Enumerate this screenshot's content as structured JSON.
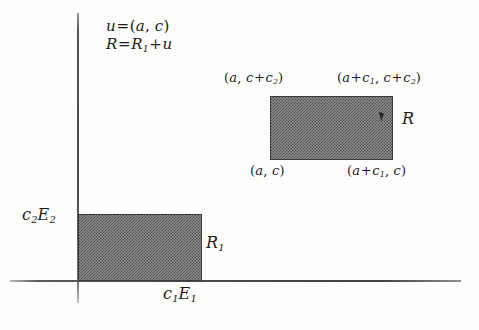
{
  "figure": {
    "background_color": "#fdfdfc",
    "axis_color": "#4a4a4a",
    "rect_fill_color": "#8c8c8c",
    "rect_border_color": "#3a3a3a"
  },
  "equations": {
    "line1": "u = (a, c)",
    "line2_prefix": "R",
    "line2": "R = R1 + u",
    "u_lhs": "u",
    "u_eq": "=",
    "u_rhs_open": "(",
    "u_a": "a",
    "u_comma": ", ",
    "u_c": "c",
    "u_rhs_close": ")",
    "R_lhs": "R",
    "R_eq": "=",
    "R_r1": "R",
    "R_r1_sub": "1",
    "R_plus": "+",
    "R_u": "u"
  },
  "upper_rect": {
    "name": "R",
    "label": "R",
    "corner_top_left": {
      "open": "(",
      "x": "a",
      "comma": ", ",
      "y_base": "c",
      "y_plus": "+",
      "y_term": "c",
      "y_sub": "2",
      "close": ")",
      "text": "(a, c+c2)"
    },
    "corner_top_right": {
      "open": "(",
      "x_base": "a",
      "x_plus": "+",
      "x_term": "c",
      "x_sub": "1",
      "comma": ", ",
      "y_base": "c",
      "y_plus": "+",
      "y_term": "c",
      "y_sub": "2",
      "close": ")",
      "text": "(a+c1, c+c2)"
    },
    "corner_bottom_left": {
      "open": "(",
      "x": "a",
      "comma": ", ",
      "y": "c",
      "close": ")",
      "text": "(a, c)"
    },
    "corner_bottom_right": {
      "open": "(",
      "x_base": "a",
      "x_plus": "+",
      "x_term": "c",
      "x_sub": "1",
      "comma": ", ",
      "y": "c",
      "close": ")",
      "text": "(a+c1, c)"
    }
  },
  "lower_rect": {
    "name": "R1",
    "label_base": "R",
    "label_sub": "1",
    "text": "R1"
  },
  "axes": {
    "y_label": {
      "coef": "c",
      "coef_sub": "2",
      "basis": "E",
      "basis_sub": "2",
      "text": "c2E2"
    },
    "x_label": {
      "coef": "c",
      "coef_sub": "1",
      "basis": "E",
      "basis_sub": "1",
      "text": "c1E1"
    }
  }
}
